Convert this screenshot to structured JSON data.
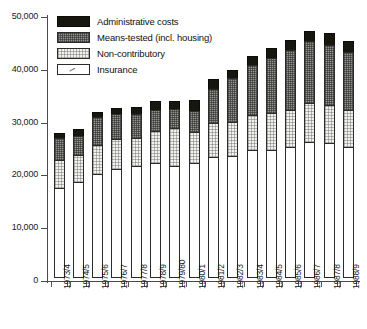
{
  "chart_data": {
    "type": "bar",
    "stacked": true,
    "title": "",
    "subtitle": "",
    "xlabel": "",
    "ylabel": "",
    "ylim": [
      0,
      50000
    ],
    "yticks": [
      "0",
      "10,000",
      "20,000",
      "30,000",
      "40,000",
      "50,000"
    ],
    "ytick_values": [
      0,
      10000,
      20000,
      30000,
      40000,
      50000
    ],
    "grid": false,
    "legend_position": "top-left",
    "categories": [
      "1973/4",
      "1974/5",
      "1975/6",
      "1976/7",
      "1977/8",
      "1978/9",
      "1979/80",
      "1980/1",
      "1981/2",
      "1982/3",
      "1983/4",
      "1984/5",
      "1985/6",
      "1986/7",
      "1987/8",
      "1988/9"
    ],
    "series": [
      {
        "name": "Insurance",
        "fill": "white",
        "values": [
          17100,
          18200,
          19700,
          20700,
          21300,
          21800,
          21300,
          21700,
          23000,
          23200,
          24200,
          24200,
          24800,
          25700,
          25500,
          24800
        ]
      },
      {
        "name": "Non-contributory",
        "fill": "light-dotted",
        "values": [
          5400,
          5300,
          5700,
          5900,
          5400,
          6300,
          7300,
          6200,
          6500,
          6600,
          6800,
          7200,
          7200,
          7600,
          7500,
          7200
        ]
      },
      {
        "name": "Means-tested (incl. housing)",
        "fill": "dark-checker",
        "values": [
          4400,
          3800,
          5500,
          4800,
          4800,
          4100,
          3700,
          4200,
          6600,
          8400,
          9800,
          10700,
          11500,
          12000,
          11600,
          11200
        ]
      },
      {
        "name": "Administrative costs",
        "fill": "black",
        "values": [
          1200,
          1500,
          1200,
          1400,
          1400,
          1900,
          1800,
          2200,
          2100,
          1800,
          1900,
          2000,
          2100,
          2100,
          2300,
          2300
        ]
      }
    ],
    "totals": [
      28100,
      28800,
      32100,
      32800,
      32900,
      34100,
      34100,
      34300,
      38200,
      40000,
      42700,
      44100,
      45600,
      47400,
      46900,
      45500
    ]
  },
  "legend": {
    "items": [
      {
        "label": "Administrative costs",
        "swatch": "black-solid-swatch"
      },
      {
        "label": "Means-tested (incl. housing)",
        "swatch": "dark-checker-swatch"
      },
      {
        "label": "Non-contributory",
        "swatch": "light-dotted-swatch"
      },
      {
        "label": "Insurance",
        "swatch": "white-swatch"
      }
    ]
  },
  "colors": {
    "administrative": "#17170f",
    "means_tested": "#949492",
    "non_contributory": "#f0f0ee",
    "insurance": "#ffffff",
    "axis": "#4a4a4a",
    "text": "#111111"
  }
}
